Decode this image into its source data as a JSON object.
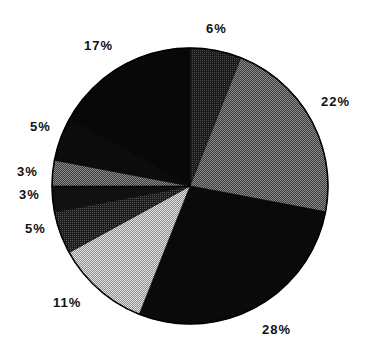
{
  "chart_data": {
    "type": "pie",
    "title": "",
    "start_angle_deg": 0,
    "direction": "clockwise",
    "center": [
      190,
      186
    ],
    "radius": 138,
    "slices": [
      {
        "label": "6%",
        "value": 6,
        "fill": "#2a2a2a",
        "pattern": "dots-dark"
      },
      {
        "label": "22%",
        "value": 22,
        "fill": "#5a5a5a",
        "pattern": "checker-mid"
      },
      {
        "label": "28%",
        "value": 28,
        "fill": "#0a0a0a",
        "pattern": "solid"
      },
      {
        "label": "11%",
        "value": 11,
        "fill": "#b8b8b8",
        "pattern": "checker-light"
      },
      {
        "label": "5%",
        "value": 5,
        "fill": "#3a3a3a",
        "pattern": "checker-dark"
      },
      {
        "label": "3%",
        "value": 3,
        "fill": "#111111",
        "pattern": "solid"
      },
      {
        "label": "3%",
        "value": 3,
        "fill": "#7a7a7a",
        "pattern": "checker-mid"
      },
      {
        "label": "5%",
        "value": 5,
        "fill": "#0c0c0c",
        "pattern": "solid"
      },
      {
        "label": "17%",
        "value": 17,
        "fill": "#080808",
        "pattern": "solid"
      }
    ],
    "labels": [
      {
        "text": "6%",
        "x": 206,
        "y": 33
      },
      {
        "text": "22%",
        "x": 321,
        "y": 106
      },
      {
        "text": "28%",
        "x": 262,
        "y": 334
      },
      {
        "text": "11%",
        "x": 53,
        "y": 307
      },
      {
        "text": "5%",
        "x": 25,
        "y": 233
      },
      {
        "text": "3%",
        "x": 19,
        "y": 199
      },
      {
        "text": "3%",
        "x": 17,
        "y": 176
      },
      {
        "text": "5%",
        "x": 30,
        "y": 131
      },
      {
        "text": "17%",
        "x": 84,
        "y": 50
      }
    ],
    "legend": null,
    "xlabel": "",
    "ylabel": ""
  }
}
